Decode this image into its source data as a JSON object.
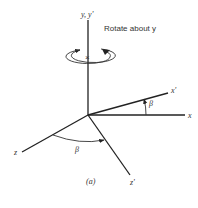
{
  "figure": {
    "caption": "(a)",
    "annotation": "Rotate about y",
    "axes": {
      "y_label": "y, y'",
      "x_label": "x",
      "x_prime_label": "x'",
      "z_label": "z",
      "z_prime_label": "z'"
    },
    "angles": {
      "xy_angle_label": "β",
      "z_angle_label": "β"
    },
    "rotation_center_mark": "×",
    "colors": {
      "line": "#222222",
      "text": "#333333",
      "background": "#ffffff"
    }
  }
}
